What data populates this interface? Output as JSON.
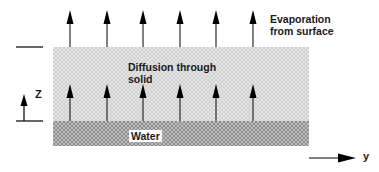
{
  "labels": {
    "evaporation_line1": "Evaporation",
    "evaporation_line2": "from surface",
    "diffusion_line1": "Diffusion through",
    "diffusion_line2": "solid",
    "water": "Water",
    "z_axis": "Z",
    "y_axis": "y"
  },
  "layers": [
    {
      "name": "solid",
      "label": "Diffusion through solid",
      "color": "#e6e6e6"
    },
    {
      "name": "water",
      "label": "Water",
      "color": "#bdbdbd"
    }
  ],
  "arrows": {
    "evaporation_count": 6,
    "diffusion_count": 6,
    "x_positions": [
      70,
      107,
      143,
      180,
      216,
      253
    ],
    "color": "#000000"
  }
}
